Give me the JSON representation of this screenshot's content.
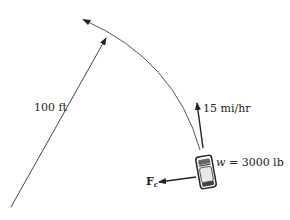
{
  "diagram": {
    "radius_label": "100 ft",
    "velocity_label": "15 mi/hr",
    "weight_label_var": "w",
    "weight_label_eq": " = 3000 lb",
    "force_label": "F",
    "force_subscript": "c"
  },
  "colors": {
    "line": "#333333",
    "arc": "#555555",
    "text": "#222222",
    "background": "#ffffff"
  }
}
